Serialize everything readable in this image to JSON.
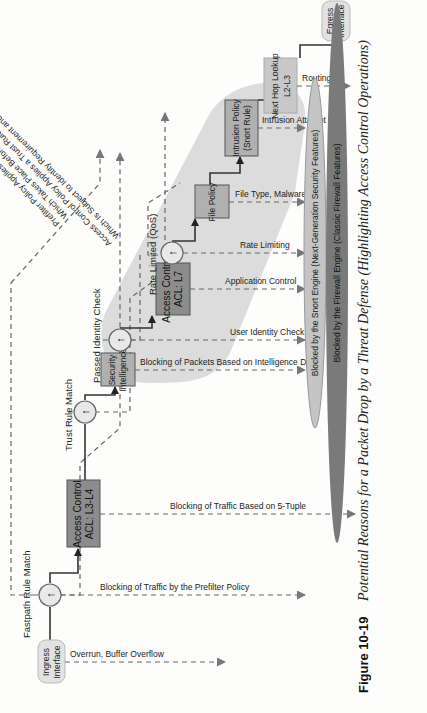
{
  "figure": {
    "number": "Figure 10-19",
    "caption": "Potential Reasons for a Packet Drop by a Threat Defense (Highlighting Access Control Operations)"
  },
  "nodes": {
    "ingress": [
      "Ingress",
      "Interface"
    ],
    "acl_l3l4": [
      "Access Control",
      "ACL: L3-L4"
    ],
    "security_intel": [
      "Security",
      "Intelligence"
    ],
    "acl_l7": [
      "Access Control",
      "ACL: L7"
    ],
    "file_policy": [
      "File Policy"
    ],
    "intrusion_policy": [
      "Intrusion Policy",
      "(Snort Rule)"
    ],
    "next_hop": [
      "Next Hop Lookup",
      "L2-L3"
    ],
    "egress": [
      "Egress",
      "Interface"
    ]
  },
  "decision_labels": {
    "fastpath": "Fastpath Rule Match",
    "trust": "Trust Rule Match",
    "identity": "Passed Identity Check",
    "rate": "Rate Limited (QoS)"
  },
  "annotations": {
    "prefilter": [
      "Prefilter Policy Applies a Fastpath Rule,",
      "Which Takes Place Before Any Analysis"
    ],
    "trust": [
      "Access Control Policy Applies a Trust Rule,",
      "Which Is Subject to Identity Requirement and Rate Limiting"
    ]
  },
  "drop_reasons": [
    "Overrun, Buffer Overflow",
    "Blocking of Traffic by the Prefilter Policy",
    "Blocking of Traffic Based on 5-Tuple",
    "Blocking of Packets Based on Intelligence Data",
    "User Identity Check",
    "Application Control",
    "Rate Limiting",
    "File Type, Malware",
    "Intrusion Attempt",
    "Routing"
  ],
  "engines": {
    "snort": "Blocked by the Snort Engine (Next-Generation Security Features)",
    "firewall": "Blocked by the Firewall Engine (Classic Firewall Features)"
  },
  "colors": {
    "box_dark": "#8c8c8c",
    "box_mid": "#a9a9a9",
    "box_light": "#c8c8c8",
    "highlight_band": "#d9d9d9",
    "snort_ellipse": "#c4c4c4",
    "firewall_ellipse": "#7a7a7a",
    "line": "#333333",
    "dashed": "#666666"
  }
}
